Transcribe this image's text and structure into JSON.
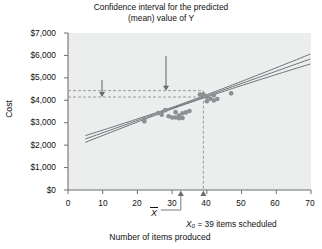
{
  "chart_data": {
    "type": "scatter",
    "title": "Confidence interval for the predicted (mean) value of Y",
    "title_line1": "Confidence interval for the predicted",
    "title_line2": "(mean) value of Y",
    "xlabel": "Number of items produced",
    "ylabel": "Cost",
    "xlim": [
      0,
      70
    ],
    "ylim": [
      0,
      7000
    ],
    "grid": false,
    "legend": "none",
    "x_ticks": [
      "0",
      "10",
      "20",
      "30",
      "40",
      "50",
      "60",
      "70"
    ],
    "x_tick_values": [
      0,
      10,
      20,
      30,
      40,
      50,
      60,
      70
    ],
    "y_ticks": [
      "$0",
      "$1,000",
      "$2,000",
      "$3,000",
      "$4,000",
      "$5,000",
      "$6,000",
      "$7,000"
    ],
    "y_tick_values": [
      0,
      1000,
      2000,
      3000,
      4000,
      5000,
      6000,
      7000
    ],
    "points": [
      {
        "x": 22,
        "y": 3180
      },
      {
        "x": 22,
        "y": 3060
      },
      {
        "x": 26,
        "y": 3430
      },
      {
        "x": 27,
        "y": 3360
      },
      {
        "x": 28,
        "y": 3560
      },
      {
        "x": 29,
        "y": 3290
      },
      {
        "x": 30,
        "y": 3230
      },
      {
        "x": 31,
        "y": 3470
      },
      {
        "x": 31,
        "y": 3230
      },
      {
        "x": 32,
        "y": 3200
      },
      {
        "x": 32,
        "y": 3320
      },
      {
        "x": 33,
        "y": 3210
      },
      {
        "x": 33,
        "y": 3420
      },
      {
        "x": 34,
        "y": 3460
      },
      {
        "x": 35,
        "y": 3520
      },
      {
        "x": 38,
        "y": 4260
      },
      {
        "x": 39,
        "y": 4270
      },
      {
        "x": 40,
        "y": 3960
      },
      {
        "x": 40,
        "y": 4150
      },
      {
        "x": 41,
        "y": 4070
      },
      {
        "x": 42,
        "y": 4220
      },
      {
        "x": 42,
        "y": 3990
      },
      {
        "x": 43,
        "y": 4060
      },
      {
        "x": 47,
        "y": 4310
      }
    ],
    "series": [
      {
        "name": "regression-line",
        "kind": "line",
        "style": "solid"
      },
      {
        "name": "upper-confidence-band",
        "kind": "line",
        "style": "solid"
      },
      {
        "name": "lower-confidence-band",
        "kind": "line",
        "style": "solid"
      }
    ],
    "annotations": {
      "lower_limit_line1": "Lower limit,",
      "lower_limit_line2": "$4,145",
      "lower_limit_value": 4145,
      "upper_limit": "Upper limit, $4,429",
      "upper_limit_value": 4429,
      "x0_label_prefix": "X",
      "x0_label_sub": "0",
      "x0_label_rest": "= 39 items scheduled",
      "x0_value": 39,
      "xbar_label": "X",
      "xbar_value": 32.5
    },
    "colors": {
      "plot_background": "#eceded",
      "point": "#8c8f93",
      "line": "#6f7378",
      "dashed": "#9a9da1",
      "axis": "#6e7173",
      "text": "#111111"
    }
  }
}
